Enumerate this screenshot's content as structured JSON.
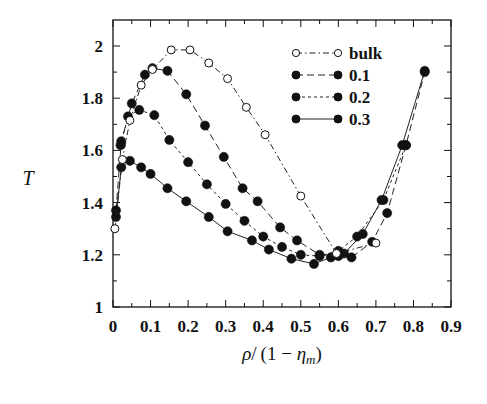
{
  "chart_data": {
    "type": "line",
    "title": "",
    "xlabel": "ρ/(1 − η_m)",
    "ylabel": "T",
    "xlim": [
      0,
      0.9
    ],
    "ylim": [
      1,
      2.1
    ],
    "xticks": [
      "0",
      "0.1",
      "0.2",
      "0.3",
      "0.4",
      "0.5",
      "0.6",
      "0.7",
      "0.8",
      "0.9"
    ],
    "yticks": [
      "1",
      "1.2",
      "1.4",
      "1.6",
      "1.8",
      "2"
    ],
    "grid": false,
    "legend_position": "upper-center-right",
    "series": [
      {
        "name": "bulk",
        "marker": "open-circle",
        "line": "dash-dot",
        "x": [
          0.005,
          0.025,
          0.045,
          0.075,
          0.105,
          0.155,
          0.205,
          0.255,
          0.305,
          0.355,
          0.405,
          0.5,
          0.595,
          0.7
        ],
        "y": [
          1.3,
          1.565,
          1.715,
          1.85,
          1.91,
          1.985,
          1.985,
          1.935,
          1.875,
          1.765,
          1.66,
          1.425,
          1.205,
          1.245
        ]
      },
      {
        "name": "0.1",
        "marker": "filled-circle",
        "line": "dashed",
        "x": [
          0.008,
          0.022,
          0.05,
          0.085,
          0.105,
          0.145,
          0.195,
          0.245,
          0.295,
          0.345,
          0.385,
          0.445,
          0.49,
          0.55,
          0.6,
          0.635,
          0.69,
          0.73,
          0.78,
          0.83
        ],
        "y": [
          1.37,
          1.635,
          1.78,
          1.89,
          1.915,
          1.905,
          1.815,
          1.695,
          1.575,
          1.455,
          1.405,
          1.305,
          1.255,
          1.2,
          1.195,
          1.19,
          1.25,
          1.36,
          1.62,
          1.9
        ]
      },
      {
        "name": "0.2",
        "marker": "filled-circle",
        "line": "short-dashed",
        "x": [
          0.02,
          0.04,
          0.07,
          0.11,
          0.15,
          0.2,
          0.25,
          0.3,
          0.35,
          0.4,
          0.45,
          0.5,
          0.55,
          0.6,
          0.65,
          0.72,
          0.78
        ],
        "y": [
          1.62,
          1.73,
          1.755,
          1.735,
          1.64,
          1.555,
          1.47,
          1.395,
          1.33,
          1.27,
          1.23,
          1.2,
          1.195,
          1.215,
          1.27,
          1.41,
          1.62
        ]
      },
      {
        "name": "0.3",
        "marker": "filled-circle",
        "line": "solid",
        "x": [
          0.008,
          0.022,
          0.045,
          0.075,
          0.1,
          0.145,
          0.195,
          0.255,
          0.305,
          0.37,
          0.415,
          0.475,
          0.535,
          0.58,
          0.615,
          0.665,
          0.715,
          0.77,
          0.83
        ],
        "y": [
          1.345,
          1.535,
          1.56,
          1.535,
          1.51,
          1.455,
          1.405,
          1.345,
          1.29,
          1.255,
          1.22,
          1.185,
          1.165,
          1.19,
          1.205,
          1.28,
          1.41,
          1.62,
          1.905
        ]
      }
    ]
  },
  "axes": {
    "xlabel_parts": {
      "rho": "ρ",
      "slash": "/",
      "open": "(1 − ",
      "eta": "η",
      "sub": "m",
      "close": ")"
    },
    "ylabel": "T"
  },
  "legend": [
    {
      "label": "bulk"
    },
    {
      "label": "0.1"
    },
    {
      "label": "0.2"
    },
    {
      "label": "0.3"
    }
  ],
  "colors": {
    "ink": "#111111",
    "background": "#ffffff"
  }
}
